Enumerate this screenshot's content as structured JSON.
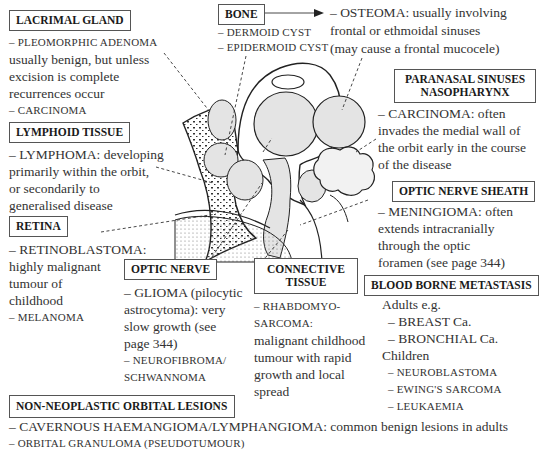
{
  "lacrimal": {
    "title": "LACRIMAL GLAND",
    "lines": [
      "– PLEOMORPHIC ADENOMA",
      "usually benign, but unless",
      "excision is complete",
      "recurrences occur",
      "– CARCINOMA"
    ]
  },
  "bone": {
    "title": "BONE",
    "lines": [
      "– DERMOID CYST",
      "– EPIDERMOID CYST"
    ],
    "arrow_lines": [
      "– OSTEOMA: usually involving",
      "frontal or ethmoidal sinuses",
      "(may cause a frontal mucocele)"
    ]
  },
  "paranasal": {
    "title_1": "PARANASAL SINUSES",
    "title_2": "NASOPHARYNX",
    "lines": [
      "– CARCINOMA: often",
      "invades the medial wall of",
      "the orbit early in the course",
      "of the disease"
    ]
  },
  "lymphoid": {
    "title": "LYMPHOID TISSUE",
    "lines": [
      "– LYMPHOMA: developing",
      "primarily within the orbit,",
      "or secondarily to",
      "generalised disease"
    ]
  },
  "retina": {
    "title": "RETINA",
    "lines": [
      "– RETINOBLASTOMA:",
      "highly malignant",
      "tumour of",
      "childhood",
      "– MELANOMA"
    ]
  },
  "optic_nerve": {
    "title": "OPTIC NERVE",
    "lines": [
      "– GLIOMA (pilocytic",
      "astrocytoma): very",
      "slow growth (see",
      "page 344)",
      "– NEUROFIBROMA/",
      "SCHWANNOMA"
    ]
  },
  "connective": {
    "title_1": "CONNECTIVE",
    "title_2": "TISSUE",
    "lines": [
      "– RHABDOMYO-",
      "SARCOMA:",
      "malignant childhood",
      "tumour with rapid",
      "growth and local",
      "spread"
    ]
  },
  "optic_sheath": {
    "title": "OPTIC NERVE SHEATH",
    "lines": [
      "– MENINGIOMA: often",
      "extends intracranially",
      "through the optic",
      "foramen (see page 344)"
    ]
  },
  "blood": {
    "title": "BLOOD BORNE METASTASIS",
    "lines": [
      "Adults e.g.",
      "– BREAST Ca.",
      "– BRONCHIAL Ca.",
      "Children",
      "– NEUROBLASTOMA",
      "– EWING'S SARCOMA",
      "– LEUKAEMIA"
    ]
  },
  "non_neoplastic": {
    "title": "NON-NEOPLASTIC ORBITAL LESIONS",
    "lines": [
      "– CAVERNOUS HAEMANGIOMA/LYMPHANGIOMA: common benign lesions in adults",
      "– ORBITAL GRANULOMA (PSEUDOTUMOUR)"
    ]
  }
}
